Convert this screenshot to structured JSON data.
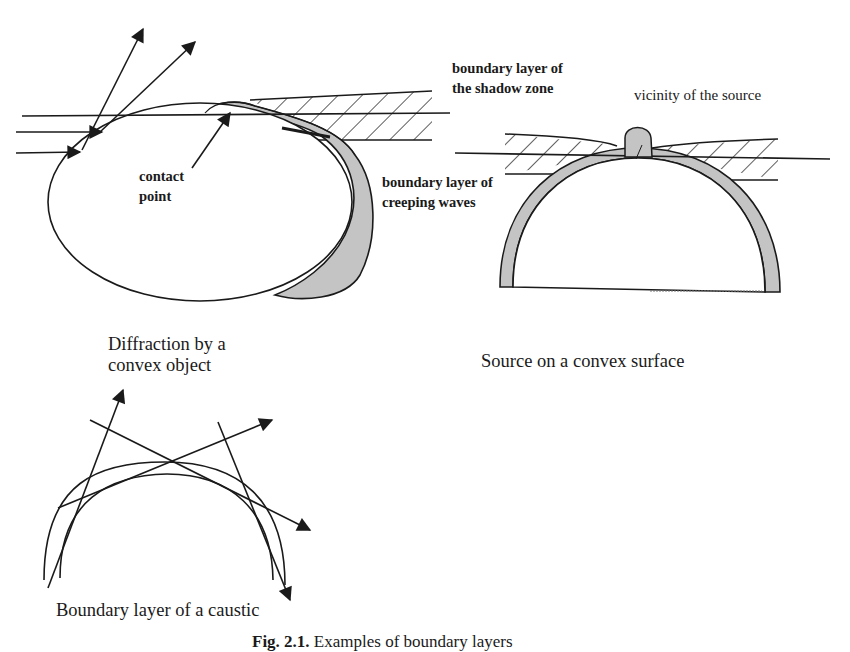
{
  "figure": {
    "panels": [
      {
        "id": "convex-object",
        "title_line1": "Diffraction by a",
        "title_line2": "convex object",
        "labels": {
          "shadow_zone_line1": "boundary layer of",
          "shadow_zone_line2": "the shadow zone",
          "contact_line1": "contact",
          "contact_line2": "point",
          "creeping_line1": "boundary layer of",
          "creeping_line2": "creeping waves"
        }
      },
      {
        "id": "source-on-surface",
        "title": "Source on a convex surface",
        "labels": {
          "vicinity": "vicinity of the source"
        }
      },
      {
        "id": "caustic",
        "title": "Boundary layer of a caustic"
      }
    ],
    "caption": {
      "number": "Fig. 2.1.",
      "text": "Examples of boundary layers"
    },
    "colors": {
      "ink": "#1a1a1a",
      "layer_fill": "#c4c4c4",
      "background": "#ffffff"
    }
  }
}
